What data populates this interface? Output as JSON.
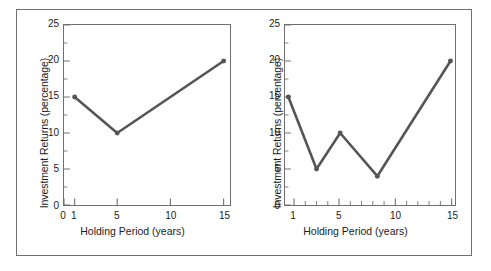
{
  "figure": {
    "background_color": "#ffffff",
    "frame_color": "#6f6f6f",
    "line_color": "#555555",
    "text_color": "#1b1b1b"
  },
  "chart_data": [
    {
      "type": "line",
      "panel": "left",
      "title": "",
      "xlabel": "Holding Period (years)",
      "ylabel": "Investment Returns (percentage)",
      "x": [
        1,
        5,
        15
      ],
      "values": [
        15,
        10,
        20
      ],
      "xlim": [
        0,
        15.6
      ],
      "ylim": [
        0,
        25
      ],
      "xticks": [
        0,
        1,
        5,
        10,
        15
      ],
      "xticklabels": [
        "0",
        "1",
        "5",
        "10",
        "15"
      ],
      "yticks": [
        0,
        5,
        10,
        15,
        20,
        25
      ],
      "yticklabels": [
        "0",
        "5",
        "10",
        "15",
        "20",
        "25"
      ],
      "yminorticks": [
        2.5,
        7.5,
        12.5,
        17.5,
        22.5
      ],
      "xminorticks": [],
      "grid": false,
      "legend": null,
      "markers": "circle",
      "linewidth": 2.6
    },
    {
      "type": "line",
      "panel": "right",
      "title": "",
      "xlabel": "Holding Period (years)",
      "ylabel": "Investment Returns (percentage)",
      "x": [
        0.5,
        3,
        5.1,
        8.4,
        14.9
      ],
      "values": [
        15,
        5,
        10,
        4,
        20
      ],
      "xlim": [
        0.2,
        15.3
      ],
      "ylim": [
        0,
        25
      ],
      "xticks": [
        1,
        5,
        10,
        15
      ],
      "xticklabels": [
        "1",
        "5",
        "10",
        "15"
      ],
      "yticks": [
        0,
        5,
        10,
        15,
        20,
        25
      ],
      "yticklabels": [
        "0",
        "5",
        "10",
        "15",
        "20",
        "25"
      ],
      "yminorticks": [
        2.5,
        7.5,
        12.5,
        17.5,
        22.5
      ],
      "xminorticks": [
        2,
        3,
        4,
        6,
        7,
        8,
        9,
        11,
        12,
        13,
        14
      ],
      "grid": false,
      "legend": null,
      "markers": "circle",
      "linewidth": 2.6
    }
  ]
}
